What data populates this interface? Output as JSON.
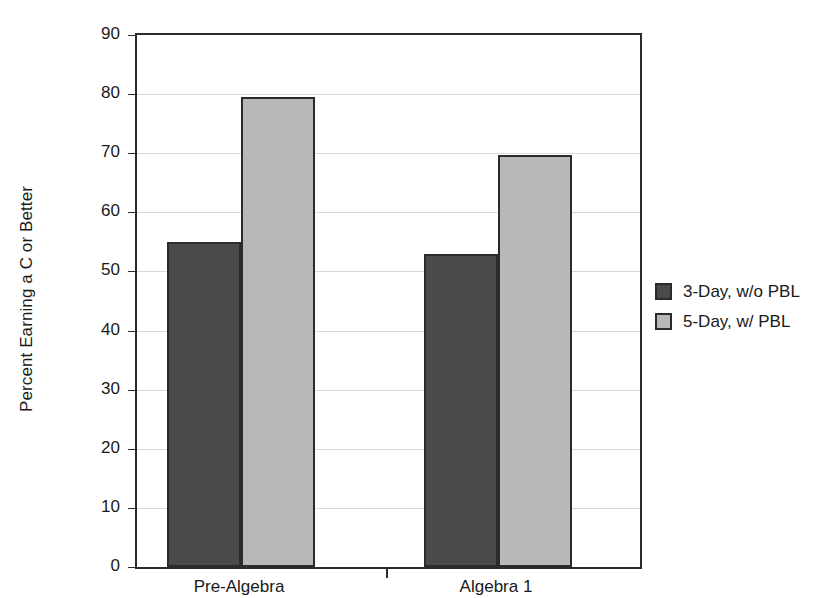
{
  "chart_data": {
    "type": "bar",
    "title": "",
    "xlabel": "",
    "ylabel": "Percent Earning a C or Better",
    "categories": [
      "Pre-Algebra",
      "Algebra 1"
    ],
    "series": [
      {
        "name": "3-Day, w/o PBL",
        "color": "#4a4a4a",
        "values": [
          55,
          53
        ]
      },
      {
        "name": "5-Day, w/ PBL",
        "color": "#b8b8b8",
        "values": [
          79.5,
          69.7
        ]
      }
    ],
    "ylim": [
      0,
      90
    ],
    "yticks": [
      0,
      10,
      20,
      30,
      40,
      50,
      60,
      70,
      80,
      90
    ],
    "ytick_labels": [
      "0",
      "10",
      "20",
      "30",
      "40",
      "50",
      "60",
      "70",
      "80",
      "90"
    ],
    "grid": true,
    "legend_position": "right",
    "axis_color": "#2b2b2b",
    "grid_color": "#d9d9d9",
    "background": "#ffffff"
  }
}
